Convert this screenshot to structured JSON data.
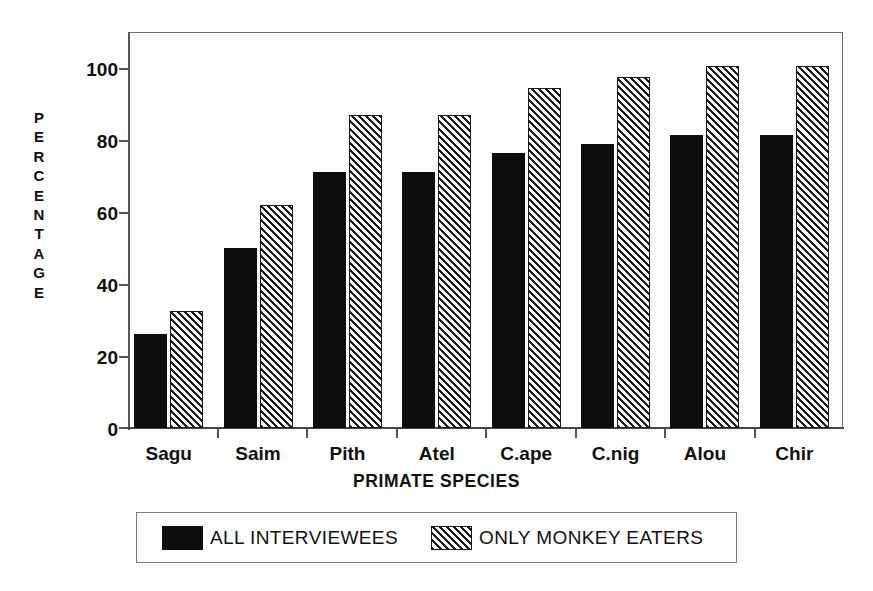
{
  "chart_data": {
    "type": "bar",
    "title": "",
    "subtitle": "",
    "xlabel": "PRIMATE SPECIES",
    "ylabel": "PERCENTAGE",
    "ylabel_letters": [
      "P",
      "E",
      "R",
      "C",
      "E",
      "N",
      "T",
      "A",
      "G",
      "E"
    ],
    "categories": [
      "Sagu",
      "Saim",
      "Pith",
      "Atel",
      "C.ape",
      "C.nig",
      "Alou",
      "Chir"
    ],
    "series": [
      {
        "name": "ALL INTERVIEWEES",
        "fill": "solid-black",
        "color": "#0d0d0d",
        "values": [
          26,
          50,
          71,
          71,
          76.5,
          79,
          81.5,
          81.5
        ]
      },
      {
        "name": "ONLY MONKEY EATERS",
        "fill": "diagonal-hatch",
        "color": "#1c1c1c",
        "values": [
          32.5,
          62,
          87,
          87,
          94.5,
          97.5,
          100.5,
          100.5
        ]
      }
    ],
    "ylim": [
      0,
      110
    ],
    "yticks": [
      0,
      20,
      40,
      60,
      80,
      100
    ],
    "ytick_labels": [
      "0",
      "20",
      "40",
      "60",
      "80",
      "100"
    ],
    "xlim": [
      0,
      8
    ],
    "grid": false,
    "legend_position": "below-axes",
    "frame": "box"
  },
  "legend": {
    "entries": [
      {
        "label": "ALL INTERVIEWEES",
        "swatch": "solid"
      },
      {
        "label": "ONLY MONKEY EATERS",
        "swatch": "hatch"
      }
    ]
  },
  "artifact": {
    "clipped_top_text": ""
  }
}
